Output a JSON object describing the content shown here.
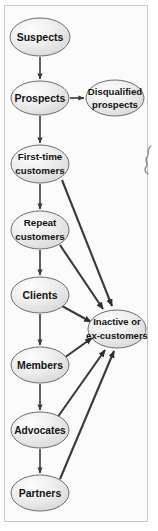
{
  "figure": {
    "background_color": "#fbfbfb",
    "frame_color": "#c9c9c9",
    "node_fill": "#ededed",
    "node_stroke": "#6d6d6d",
    "edge_color": "#3a3a3a",
    "text_color": "#131313"
  },
  "nodes": [
    {
      "id": "suspects",
      "label": "Suspects",
      "lines": [
        "Suspects"
      ],
      "cx": 40,
      "cy": 37,
      "rx": 30,
      "ry": 19
    },
    {
      "id": "prospects",
      "label": "Prospects",
      "lines": [
        "Prospects"
      ],
      "cx": 40,
      "cy": 98,
      "rx": 29,
      "ry": 17
    },
    {
      "id": "disqualified",
      "label": "Disqualified prospects",
      "lines": [
        "Disqualified",
        "prospects"
      ],
      "cx": 115,
      "cy": 98,
      "rx": 29,
      "ry": 18
    },
    {
      "id": "first-time",
      "label": "First-time customers",
      "lines": [
        "First-time",
        "customers"
      ],
      "cx": 40,
      "cy": 164,
      "rx": 29,
      "ry": 19
    },
    {
      "id": "repeat",
      "label": "Repeat customers",
      "lines": [
        "Repeat",
        "customers"
      ],
      "cx": 40,
      "cy": 230,
      "rx": 29,
      "ry": 19
    },
    {
      "id": "clients",
      "label": "Clients",
      "lines": [
        "Clients"
      ],
      "cx": 40,
      "cy": 295,
      "rx": 29,
      "ry": 18
    },
    {
      "id": "inactive",
      "label": "Inactive or ex-customers",
      "lines": [
        "Inactive or",
        "ex-customers"
      ],
      "cx": 117,
      "cy": 329,
      "rx": 29,
      "ry": 19
    },
    {
      "id": "members",
      "label": "Members",
      "lines": [
        "Members"
      ],
      "cx": 40,
      "cy": 365,
      "rx": 29,
      "ry": 18
    },
    {
      "id": "advocates",
      "label": "Advocates",
      "lines": [
        "Advocates"
      ],
      "cx": 40,
      "cy": 430,
      "rx": 29,
      "ry": 18
    },
    {
      "id": "partners",
      "label": "Partners",
      "lines": [
        "Partners"
      ],
      "cx": 40,
      "cy": 493,
      "rx": 29,
      "ry": 18
    }
  ],
  "edges": [
    {
      "id": "suspects-to-prospects",
      "from": "suspects",
      "to": "prospects",
      "kind": "vertical"
    },
    {
      "id": "prospects-to-disqualified",
      "from": "prospects",
      "to": "disqualified",
      "kind": "horizontal"
    },
    {
      "id": "prospects-to-first-time",
      "from": "prospects",
      "to": "first-time",
      "kind": "vertical"
    },
    {
      "id": "first-time-to-repeat",
      "from": "first-time",
      "to": "repeat",
      "kind": "vertical"
    },
    {
      "id": "repeat-to-clients",
      "from": "repeat",
      "to": "clients",
      "kind": "vertical"
    },
    {
      "id": "clients-to-members",
      "from": "clients",
      "to": "members",
      "kind": "vertical"
    },
    {
      "id": "members-to-advocates",
      "from": "members",
      "to": "advocates",
      "kind": "vertical"
    },
    {
      "id": "advocates-to-partners",
      "from": "advocates",
      "to": "partners",
      "kind": "vertical"
    },
    {
      "id": "first-time-to-inactive",
      "from": "first-time",
      "to": "inactive",
      "kind": "diagonal"
    },
    {
      "id": "repeat-to-inactive",
      "from": "repeat",
      "to": "inactive",
      "kind": "diagonal"
    },
    {
      "id": "clients-to-inactive",
      "from": "clients",
      "to": "inactive",
      "kind": "diagonal"
    },
    {
      "id": "members-to-inactive",
      "from": "members",
      "to": "inactive",
      "kind": "diagonal"
    },
    {
      "id": "advocates-to-inactive",
      "from": "advocates",
      "to": "inactive",
      "kind": "diagonal"
    },
    {
      "id": "partners-to-inactive",
      "from": "partners",
      "to": "inactive",
      "kind": "diagonal"
    }
  ],
  "margin_mark": {
    "id": "page-edge-squiggle",
    "description": "hand-drawn squiggle at right page margin"
  }
}
